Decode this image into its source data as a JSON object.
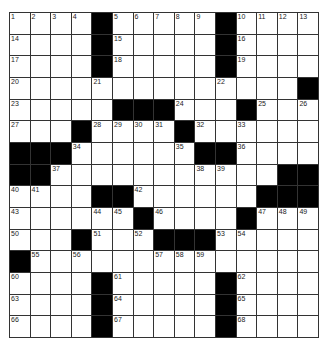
{
  "puzzle": {
    "rows": 15,
    "cols": 15,
    "colors": {
      "black": "#000000",
      "white": "#ffffff",
      "line": "#333333"
    },
    "grid": [
      [
        "1",
        "2",
        "3",
        "4",
        "#",
        "5",
        "6",
        "7",
        "8",
        "9",
        "#",
        "10",
        "11",
        "12",
        "13"
      ],
      [
        "14",
        "",
        "",
        "",
        "#",
        "15",
        "",
        "",
        "",
        "",
        "#",
        "16",
        "",
        "",
        ""
      ],
      [
        "17",
        "",
        "",
        "",
        "#",
        "18",
        "",
        "",
        "",
        "",
        "#",
        "19",
        "",
        "",
        ""
      ],
      [
        "20",
        "",
        "",
        "",
        "21",
        "",
        "",
        "",
        "",
        "",
        "22",
        "",
        "",
        "",
        "#"
      ],
      [
        "23",
        "",
        "",
        "",
        "",
        "#",
        "#",
        "#",
        "24",
        "",
        "",
        "#",
        "25",
        "",
        "26"
      ],
      [
        "27",
        "",
        "",
        "#",
        "28",
        "29",
        "30",
        "31",
        "#",
        "32",
        "",
        "33",
        "",
        "",
        ""
      ],
      [
        "#",
        "#",
        "#",
        "34",
        "",
        "",
        "",
        "",
        "35",
        "#",
        "#",
        "36",
        "",
        "",
        ""
      ],
      [
        "#",
        "#",
        "37",
        "",
        "",
        "",
        "",
        "",
        "",
        "38",
        "39",
        "",
        "",
        "#",
        "#"
      ],
      [
        "40",
        "41",
        "",
        "",
        "#",
        "#",
        "42",
        "",
        "",
        "",
        "",
        "",
        "#",
        "#",
        "#"
      ],
      [
        "43",
        "",
        "",
        "",
        "44",
        "45",
        "#",
        "46",
        "",
        "",
        "",
        "#",
        "47",
        "48",
        "49"
      ],
      [
        "50",
        "",
        "",
        "#",
        "51",
        "",
        "52",
        "#",
        "#",
        "#",
        "53",
        "54",
        "",
        "",
        ""
      ],
      [
        "#",
        "55",
        "",
        "56",
        "",
        "",
        "",
        "57",
        "58",
        "59",
        "",
        "",
        "",
        "",
        ""
      ],
      [
        "60",
        "",
        "",
        "",
        "#",
        "61",
        "",
        "",
        "",
        "",
        "#",
        "62",
        "",
        "",
        ""
      ],
      [
        "63",
        "",
        "",
        "",
        "#",
        "64",
        "",
        "",
        "",
        "",
        "#",
        "65",
        "",
        "",
        ""
      ],
      [
        "66",
        "",
        "",
        "",
        "#",
        "67",
        "",
        "",
        "",
        "",
        "#",
        "68",
        "",
        "",
        ""
      ]
    ]
  }
}
